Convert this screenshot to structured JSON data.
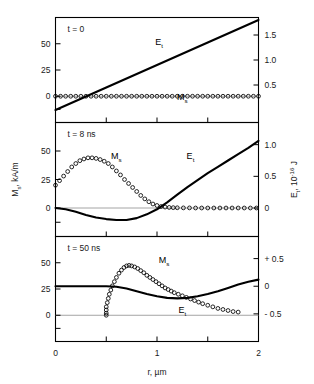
{
  "figure": {
    "xaxis": {
      "label": "r, µm",
      "label_main": "r",
      "label_unit": ", µm",
      "ticks": [
        "0",
        "1",
        "2"
      ],
      "tick_values": [
        0,
        1,
        2
      ],
      "minor_ticks": [
        0.5,
        1.5
      ],
      "range": [
        0,
        2
      ]
    },
    "yaxis_left": {
      "label_main": "M",
      "label_sub": "s",
      "label_unit": ", kA/m",
      "label": "M_s, kA/m",
      "ticks": [
        "50",
        "25",
        "0"
      ],
      "tick_values": [
        50,
        25,
        0
      ],
      "range": [
        -25,
        75
      ]
    },
    "yaxis_right": {
      "label_main": "E",
      "label_sub": "t",
      "label_unit": ", 10",
      "label_exp": "-16",
      "label_unit2": " J",
      "label": "E_t, 10^-16 J"
    },
    "panels": [
      {
        "annotation": "t = 0",
        "right_ticks": [
          "1.5",
          "1.0",
          "0.5"
        ],
        "right_tick_values": [
          1.5,
          1.0,
          0.5
        ],
        "right_range": [
          -0.25,
          1.85
        ],
        "labels": [
          {
            "main": "E",
            "sub": "t",
            "x": 1.02,
            "y_px": 45
          },
          {
            "main": "M",
            "sub": "s",
            "x": 1.25,
            "y_px": 100
          }
        ]
      },
      {
        "annotation": "t = 8 ns",
        "right_ticks": [
          "1.0",
          "0.5",
          "0"
        ],
        "right_tick_values": [
          1.0,
          0.5,
          0.0
        ],
        "right_range": [
          -0.45,
          1.35
        ],
        "labels": [
          {
            "main": "M",
            "sub": "s",
            "x": 0.6,
            "y_px": 159
          },
          {
            "main": "E",
            "sub": "t",
            "x": 1.33,
            "y_px": 159
          }
        ]
      },
      {
        "annotation": "t = 50 ns",
        "right_ticks": [
          "+ 0.5",
          "0",
          "- 0.5"
        ],
        "right_tick_values": [
          0.5,
          0.0,
          -0.5
        ],
        "right_range": [
          -1.0,
          0.9
        ],
        "labels": [
          {
            "main": "M",
            "sub": "s",
            "x": 1.07,
            "y_px": 263
          },
          {
            "main": "E",
            "sub": "t",
            "x": 1.25,
            "y_px": 313
          }
        ]
      }
    ],
    "chart_data": {
      "type": "line",
      "title": "",
      "xlabel": "r, µm",
      "ylabel": "M_s, kA/m",
      "ylabel_right": "E_t, 10^-16 J",
      "xlim": [
        0,
        2
      ],
      "grid": false,
      "legend": "inline annotations",
      "panels": [
        {
          "name": "t = 0",
          "ylim_left": [
            -25,
            75
          ],
          "ylim_right": [
            -0.25,
            1.85
          ],
          "series": [
            {
              "name": "E_t",
              "style": "line",
              "axis": "right",
              "x": [
                0.0,
                0.25,
                0.5,
                0.75,
                1.0,
                1.25,
                1.5,
                1.75,
                2.0
              ],
              "values": [
                0.0,
                0.225,
                0.45,
                0.675,
                0.9,
                1.125,
                1.35,
                1.575,
                1.8
              ]
            },
            {
              "name": "M_s",
              "style": "circles",
              "axis": "left",
              "x": [
                0.0,
                0.05,
                0.1,
                0.15,
                0.2,
                0.25,
                0.3,
                0.35,
                0.4,
                0.45,
                0.5,
                0.55,
                0.6,
                0.65,
                0.7,
                0.75,
                0.8,
                0.85,
                0.9,
                0.95,
                1.0,
                1.05,
                1.1,
                1.15,
                1.2,
                1.25,
                1.3,
                1.35,
                1.4,
                1.45,
                1.5,
                1.55,
                1.6,
                1.65,
                1.7,
                1.75,
                1.8,
                1.85,
                1.9,
                1.95,
                2.0
              ],
              "values": [
                0,
                0,
                0,
                0,
                0,
                0,
                0,
                0,
                0,
                0,
                0,
                0,
                0,
                0,
                0,
                0,
                0,
                0,
                0,
                0,
                0,
                0,
                0,
                0,
                0,
                0,
                0,
                0,
                0,
                0,
                0,
                0,
                0,
                0,
                0,
                0,
                0,
                0,
                0,
                0,
                0
              ]
            }
          ]
        },
        {
          "name": "t = 8 ns",
          "ylim_left": [
            -25,
            75
          ],
          "ylim_right": [
            -0.45,
            1.35
          ],
          "series": [
            {
              "name": "M_s",
              "style": "circles",
              "axis": "left",
              "x": [
                0.0,
                0.04,
                0.08,
                0.12,
                0.16,
                0.2,
                0.24,
                0.28,
                0.32,
                0.36,
                0.4,
                0.44,
                0.48,
                0.52,
                0.56,
                0.6,
                0.64,
                0.68,
                0.72,
                0.76,
                0.8,
                0.84,
                0.88,
                0.92,
                0.96,
                1.0,
                1.04,
                1.08,
                1.12,
                1.16,
                1.2,
                1.26,
                1.32,
                1.38,
                1.44,
                1.5,
                1.56,
                1.62,
                1.68,
                1.74,
                1.8,
                1.86,
                1.92,
                1.98
              ],
              "values": [
                20,
                24,
                28,
                32,
                36,
                39,
                41.5,
                43,
                44,
                44,
                43.5,
                42.5,
                41,
                39,
                36,
                32.5,
                29,
                25,
                21.5,
                18,
                14.5,
                11,
                8,
                5.5,
                3.5,
                2.2,
                1.3,
                0.8,
                0.5,
                0.3,
                0.2,
                0.1,
                0.1,
                0.0,
                0.0,
                0.0,
                0.0,
                0.0,
                0.0,
                0.0,
                0.0,
                0.0,
                0.0,
                0.0
              ]
            },
            {
              "name": "E_t",
              "style": "line",
              "axis": "right",
              "x": [
                0.0,
                0.1,
                0.2,
                0.3,
                0.4,
                0.5,
                0.6,
                0.7,
                0.8,
                0.9,
                1.0,
                1.1,
                1.2,
                1.3,
                1.4,
                1.5,
                1.6,
                1.7,
                1.8,
                1.9,
                2.0
              ],
              "values": [
                0.0,
                -0.02,
                -0.06,
                -0.11,
                -0.15,
                -0.175,
                -0.19,
                -0.19,
                -0.16,
                -0.1,
                -0.02,
                0.09,
                0.21,
                0.33,
                0.44,
                0.55,
                0.65,
                0.75,
                0.85,
                0.95,
                1.06
              ]
            }
          ]
        },
        {
          "name": "t = 50 ns",
          "ylim_left": [
            -25,
            75
          ],
          "ylim_right": [
            -1.0,
            0.9
          ],
          "series": [
            {
              "name": "M_s",
              "style": "circles",
              "axis": "left",
              "x": [
                0.5,
                0.5,
                0.5,
                0.5,
                0.51,
                0.52,
                0.53,
                0.545,
                0.56,
                0.58,
                0.6,
                0.625,
                0.65,
                0.675,
                0.7,
                0.725,
                0.75,
                0.78,
                0.81,
                0.84,
                0.87,
                0.9,
                0.93,
                0.96,
                0.99,
                1.02,
                1.05,
                1.08,
                1.11,
                1.14,
                1.17,
                1.21,
                1.25,
                1.29,
                1.33,
                1.37,
                1.41,
                1.45,
                1.5,
                1.55,
                1.6,
                1.65,
                1.7,
                1.75,
                1.8
              ],
              "values": [
                0,
                2,
                5,
                8,
                12,
                16,
                20,
                24,
                28,
                32,
                36,
                40,
                43,
                45.5,
                47,
                47.5,
                47,
                46,
                44.5,
                42.5,
                40.5,
                38,
                36,
                34,
                32,
                30,
                28,
                26,
                24.5,
                23,
                21.5,
                20,
                18.5,
                17,
                15.5,
                14,
                12.5,
                11,
                9.5,
                8,
                6.5,
                5.5,
                4.5,
                3.5,
                3
              ]
            },
            {
              "name": "E_t",
              "style": "line",
              "axis": "right",
              "x": [
                0.0,
                0.1,
                0.2,
                0.3,
                0.4,
                0.5,
                0.6,
                0.7,
                0.8,
                0.9,
                1.0,
                1.1,
                1.2,
                1.3,
                1.4,
                1.5,
                1.6,
                1.7,
                1.8,
                1.9,
                2.0
              ],
              "values": [
                0.0,
                0.0,
                0.0,
                0.0,
                0.0,
                0.0,
                -0.01,
                -0.04,
                -0.09,
                -0.14,
                -0.18,
                -0.21,
                -0.22,
                -0.21,
                -0.18,
                -0.14,
                -0.09,
                -0.03,
                0.03,
                0.08,
                0.12
              ]
            }
          ]
        }
      ]
    }
  }
}
